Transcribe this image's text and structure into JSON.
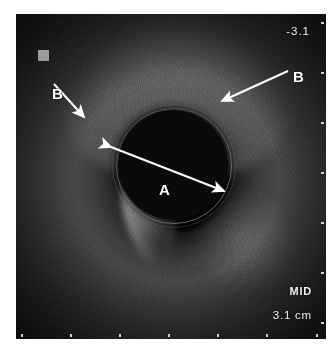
{
  "image": {
    "modality": "intravascular-ultrasound",
    "frame_background": "#0d0d0d",
    "page_background": "#ffffff"
  },
  "readouts": {
    "depth_top": "-3.1",
    "segment_tag": "MID",
    "depth_scale": "3.1 cm"
  },
  "annotations": [
    {
      "id": "a",
      "label": "A",
      "kind": "double-arrow",
      "target": "lumen-diameter"
    },
    {
      "id": "b-left",
      "label": "B",
      "kind": "arrow",
      "target": "vessel-wall-left"
    },
    {
      "id": "b-right",
      "label": "B",
      "kind": "arrow",
      "target": "vessel-wall-right"
    }
  ],
  "markers": {
    "calibration_square_color": "#9b9b9b",
    "tick_color": "#cfcfcf",
    "bottom_tick_count": 7,
    "right_tick_count": 7,
    "annotation_color": "#ffffff"
  }
}
